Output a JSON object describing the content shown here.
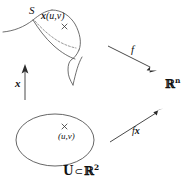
{
  "figure": {
    "type": "math-diagram",
    "background_color": "#ffffff",
    "stroke_color": "#3a3a3a",
    "text_color": "#111111"
  },
  "labels": {
    "surface_name": "S",
    "patch_point_fn": "x",
    "patch_point_arg": "(u,v)",
    "param_map": "x",
    "function_f": "f",
    "composition_prefix": "f",
    "composition_suffix": "x",
    "codomain": "ℝ",
    "codomain_exponent": "n",
    "domain_set": "U",
    "subset_symbol": "⊂",
    "domain_ambient": "ℝ",
    "domain_exponent": "2",
    "point_uv": "(u,v)",
    "cross_mark": "×"
  },
  "elements": {
    "surface_patch": "curved-surface-with-dashed-patch",
    "domain_ellipse": "open-set-ellipse",
    "arrow_vertical": "param-map-arrow-up",
    "arrow_f": "arrow-down-right-f",
    "arrow_fx": "arrow-up-right-fx"
  }
}
